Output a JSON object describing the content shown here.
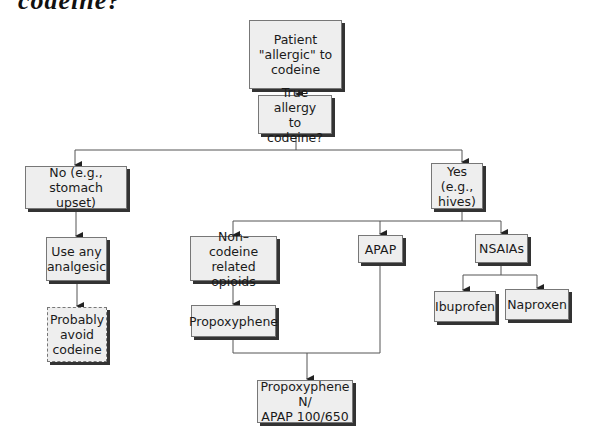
{
  "title_fragment": "codeine?",
  "nodes": {
    "root": "Patient\n\"allergic\" to\ncodeine",
    "question": "True allergy\nto codeine?",
    "no": "No (e.g., stomach\nupset)",
    "yes": "Yes (e.g.,\nhives)",
    "use_any": "Use any\nanalgesic",
    "avoid": "Probably\navoid\ncodeine",
    "non_codeine": "Non–codeine\nrelated opioids",
    "apap": "APAP",
    "nsaias": "NSAIAs",
    "propoxyphene": "Propoxyphene",
    "ibuprofen": "Ibuprofen",
    "naproxen": "Naproxen",
    "combo": "Propoxyphene N/\nAPAP 100/650"
  },
  "colors": {
    "box_fill": "#eeeeee",
    "box_border": "#777777",
    "shadow": "#333333",
    "line": "#555555"
  }
}
